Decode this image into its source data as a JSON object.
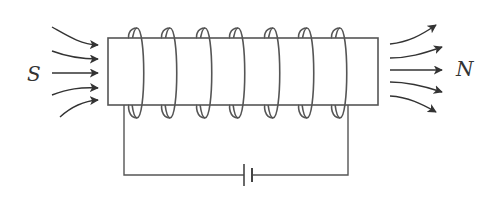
{
  "diagram": {
    "type": "solenoid-magnetic-field",
    "labels": {
      "south": "S",
      "north": "N"
    },
    "coil": {
      "turns": 7
    },
    "field_arrows": {
      "left_count": 5,
      "right_count": 5
    },
    "circuit": {
      "source": "battery"
    },
    "colors": {
      "stroke": "#444444",
      "background": "#ffffff"
    }
  }
}
